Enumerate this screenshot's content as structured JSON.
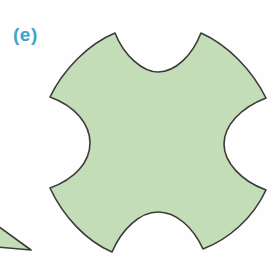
{
  "figure": {
    "label": "(e)",
    "label_color": "#3aa6c8",
    "background_color": "#fefefe",
    "shapes": {
      "main": {
        "name": "four-cusped-concave-square",
        "fill_color": "#c3ddb6",
        "stroke_color": "#3b3b3b",
        "stroke_width": 1.6,
        "description": "Square-like tile with four concave circular arcs cut into its edges, meeting at four sharp cusps",
        "cusps": [
          {
            "x": 50,
            "y": 97
          },
          {
            "x": 115,
            "y": 33
          },
          {
            "x": 201,
            "y": 33
          },
          {
            "x": 266,
            "y": 98
          },
          {
            "x": 266,
            "y": 190
          },
          {
            "x": 203,
            "y": 249
          },
          {
            "x": 112,
            "y": 252
          },
          {
            "x": 50,
            "y": 188
          }
        ],
        "path": "M 50 97 C 63 70 88 44 115 33 C 124 56 143 72 158 72 C 175 72 192 56 201 33 C 228 45 252 70 266 98 C 240 108 224 126 224 144 C 224 162 241 181 266 190 C 253 218 229 239 203 249 C 193 227 176 212 158 212 C 140 212 122 229 112 252 C 86 241 63 216 50 188 C 75 179 90 162 90 143 C 90 124 75 106 50 97 Z"
      },
      "partial_neighbor": {
        "name": "adjacent-tile-sliver",
        "fill_color": "#c3ddb6",
        "stroke_color": "#3b3b3b",
        "stroke_width": 1.6,
        "description": "Thin wedge of a neighbouring tile cropped by the left edge of the panel",
        "path": "M -2 226 L 31 250 L -2 247 Z"
      }
    }
  }
}
